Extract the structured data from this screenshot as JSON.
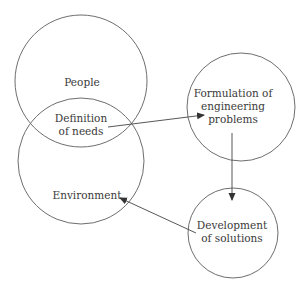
{
  "diagram": {
    "colors": {
      "stroke": "#6e6e6e",
      "text": "#3a3a3a",
      "background": "#ffffff"
    },
    "nodes": [
      {
        "id": "people",
        "label": "People",
        "lines": [
          "People"
        ]
      },
      {
        "id": "definition",
        "label": "Definition of needs",
        "lines": [
          "Definition",
          "of needs"
        ]
      },
      {
        "id": "environment",
        "label": "Environment",
        "lines": [
          "Environment"
        ]
      },
      {
        "id": "formulation",
        "label": "Formulation of engineering problems",
        "lines": [
          "Formulation of",
          "engineering",
          "problems"
        ]
      },
      {
        "id": "development",
        "label": "Development of solutions",
        "lines": [
          "Development",
          "of solutions"
        ]
      }
    ],
    "edges": [
      {
        "from": "definition",
        "to": "formulation"
      },
      {
        "from": "formulation",
        "to": "development"
      },
      {
        "from": "development",
        "to": "environment"
      }
    ]
  }
}
